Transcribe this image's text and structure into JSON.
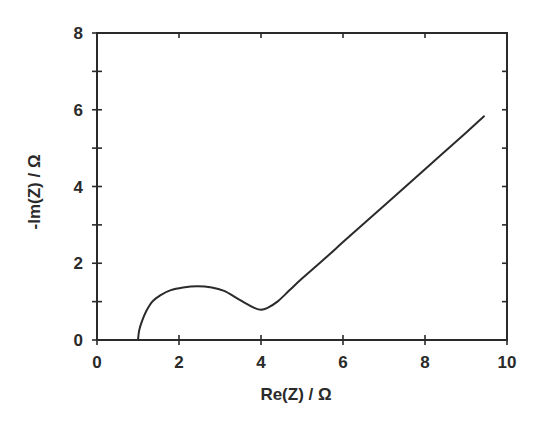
{
  "chart_data": {
    "type": "line",
    "title": "",
    "xlabel": "Re(Z) / Ω",
    "ylabel": "-Im(Z) / Ω",
    "xlim": [
      0,
      10
    ],
    "ylim": [
      0,
      8
    ],
    "x_ticks": [
      0,
      2,
      4,
      6,
      8,
      10
    ],
    "x_tick_labels": [
      "0",
      "2",
      "4",
      "6",
      "8",
      "10"
    ],
    "x_minor_ticks": [],
    "y_ticks": [
      0,
      2,
      4,
      6,
      8
    ],
    "y_tick_labels": [
      "0",
      "2",
      "4",
      "6",
      "8"
    ],
    "y_minor_ticks": [
      1,
      3,
      5,
      7
    ],
    "grid": false,
    "legend": null,
    "series": [
      {
        "name": "Nyquist impedance",
        "x": [
          1.0,
          1.03,
          1.1,
          1.2,
          1.35,
          1.55,
          1.8,
          2.1,
          2.45,
          2.8,
          3.1,
          3.4,
          3.65,
          3.85,
          4.0,
          4.15,
          4.4,
          4.7,
          5.0,
          5.68,
          6.0,
          7.0,
          8.0,
          9.0,
          9.44
        ],
        "y": [
          0.0,
          0.25,
          0.5,
          0.75,
          1.0,
          1.17,
          1.3,
          1.37,
          1.4,
          1.37,
          1.28,
          1.1,
          0.94,
          0.83,
          0.79,
          0.83,
          1.0,
          1.3,
          1.6,
          2.24,
          2.55,
          3.5,
          4.45,
          5.4,
          5.83
        ]
      }
    ]
  }
}
